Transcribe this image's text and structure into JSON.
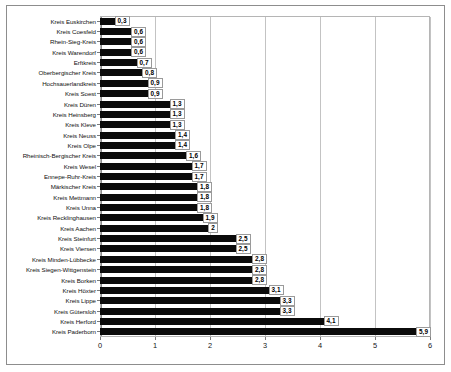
{
  "chart_data": {
    "type": "bar",
    "orientation": "horizontal",
    "title": "",
    "subtitle": "",
    "xlabel": "",
    "ylabel": "",
    "xlim": [
      0,
      6
    ],
    "xticks": [
      0,
      1,
      2,
      3,
      4,
      5,
      6
    ],
    "xtick_labels": [
      "0",
      "1",
      "2",
      "3",
      "4",
      "5",
      "6"
    ],
    "grid": "vertical",
    "legend": "none",
    "bar_color": "#0b0b0b",
    "data_labels": true,
    "categories": [
      "Kreis Euskirchen",
      "Kreis Coesfeld",
      "Rhein-Sieg-Kreis",
      "Kreis Warendorf",
      "Erftkreis",
      "Oberbergischer Kreis",
      "Hochsauerlandkreis",
      "Kreis Soest",
      "Kreis Düren",
      "Kreis Heinsberg",
      "Kreis Kleve",
      "Kreis Neuss",
      "Kreis Olpe",
      "Rheinisch-Bergischer Kreis",
      "Kreis Wesel",
      "Ennepe-Ruhr-Kreis",
      "Märkischer Kreis",
      "Kreis Mettmann",
      "Kreis Unna",
      "Kreis Recklinghausen",
      "Kreis Aachen",
      "Kreis Steinfurt",
      "Kreis Viersen",
      "Kreis Minden-Lübbecke",
      "Kreis Siegen-Wittgenstein",
      "Kreis Borken",
      "Kreis Höxter",
      "Kreis Lippe",
      "Kreis Gütersloh",
      "Kreis Herford",
      "Kreis Paderborn"
    ],
    "values": [
      0.3,
      0.6,
      0.6,
      0.6,
      0.7,
      0.8,
      0.9,
      0.9,
      1.3,
      1.3,
      1.3,
      1.4,
      1.4,
      1.6,
      1.7,
      1.7,
      1.8,
      1.8,
      1.8,
      1.9,
      2,
      2.5,
      2.5,
      2.8,
      2.8,
      2.8,
      3.1,
      3.3,
      3.3,
      4.1,
      5.9
    ],
    "value_labels": [
      "0,3",
      "0,6",
      "0,6",
      "0,6",
      "0,7",
      "0,8",
      "0,9",
      "0,9",
      "1,3",
      "1,3",
      "1,3",
      "1,4",
      "1,4",
      "1,6",
      "1,7",
      "1,7",
      "1,8",
      "1,8",
      "1,8",
      "1,9",
      "2",
      "2,5",
      "2,5",
      "2,8",
      "2,8",
      "2,8",
      "3,1",
      "3,3",
      "3,3",
      "4,1",
      "5,9"
    ]
  }
}
